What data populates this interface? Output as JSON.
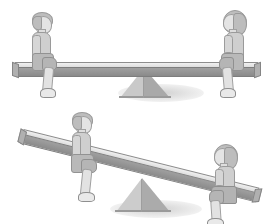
{
  "image": {
    "title": "Two seesaw illustrations",
    "background_color": "#ffffff",
    "style": "grayscale line illustration",
    "width": 273,
    "height": 224
  },
  "palette": {
    "plank_top": "#e6e6e6",
    "plank_face": "#969696",
    "fulcrum_light": "#d2d2d2",
    "fulcrum_dark": "#a8a8a8",
    "outline": "#8d8d8d",
    "skin": "#e4e4e4",
    "hair": "#bdbdbd",
    "shirt": "#cfcfcf",
    "shorts": "#b5b5b5",
    "shoe": "#e9e9e9",
    "shadow": "rgba(140,140,140,0.40)"
  },
  "scenes": [
    {
      "id": "scene-balanced",
      "name": "balanced-seesaw",
      "state_label": "balanced",
      "plank": {
        "tilt_degrees": 0,
        "length": 237
      },
      "fulcrum": {
        "shape": "triangle",
        "label": "fulcrum"
      },
      "riders": [
        {
          "id": "boy-left-top",
          "name": "boy",
          "position": "left",
          "facing": "right",
          "hair": "short",
          "clothing": "t-shirt and shorts"
        },
        {
          "id": "girl-right-top",
          "name": "girl",
          "position": "right",
          "facing": "left",
          "hair": "bob",
          "clothing": "t-shirt and shorts"
        }
      ]
    },
    {
      "id": "scene-tilted",
      "name": "tilted-seesaw",
      "state_label": "tilted",
      "plank": {
        "tilt_degrees": 14,
        "length": 237
      },
      "fulcrum": {
        "shape": "triangle",
        "label": "fulcrum"
      },
      "riders": [
        {
          "id": "boy-left-bottom",
          "name": "boy",
          "position": "left-raised",
          "facing": "right",
          "hair": "short",
          "clothing": "t-shirt and shorts"
        },
        {
          "id": "girl-right-bottom",
          "name": "girl",
          "position": "right-lowered",
          "facing": "left",
          "hair": "bob",
          "clothing": "t-shirt and skirt"
        }
      ]
    }
  ]
}
